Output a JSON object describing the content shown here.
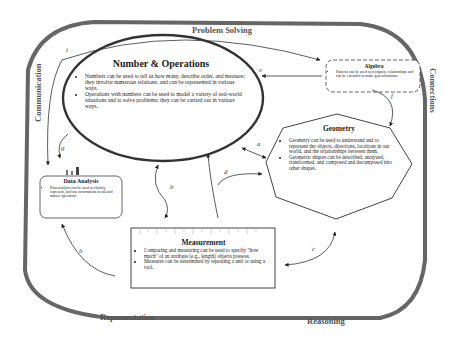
{
  "frame_labels": {
    "top": "Problem Solving",
    "left": "Communication",
    "right": "Connections",
    "bottom_left": "Representation",
    "bottom_right": "Reasoning"
  },
  "nodes": {
    "number_operations": {
      "title": "Number & Operations",
      "bullets": [
        "Numbers can be used to tell us how many, describe order, and measure; they involve numerous relations, and can be represented in various ways.",
        "Operations with numbers can be used to model a variety of real-world situations and to solve problems; they can be carried out in various ways."
      ]
    },
    "algebra": {
      "title": "Algebra",
      "bullets": [
        "Patterns can be used to recognize relationships and can be extended to make generalizations."
      ]
    },
    "geometry": {
      "title": "Geometry",
      "bullets": [
        "Geometry can be used to understand and to represent the objects, directions, locations in our world, and the relationships between them.",
        "Geometric shapes can be described, analyzed, transformed, and composed and decomposed into other shapes."
      ]
    },
    "data_analysis": {
      "title": "Data Analysis",
      "bullets": [
        "Data analysis can be used to classify, represent, and use information to ask and answer questions."
      ]
    },
    "measurement": {
      "title": "Measurement",
      "bullets": [
        "Comparing and measuring can be used to specify \"how much\" of an attribute (e.g., length) objects possess.",
        "Measures can be determined by repeating a unit or using a tool."
      ]
    }
  },
  "edges": {
    "a": "a",
    "b": "b",
    "c": "c",
    "d": "d",
    "e": "e",
    "f": "f",
    "g": "g",
    "h": "h",
    "i": "i"
  }
}
